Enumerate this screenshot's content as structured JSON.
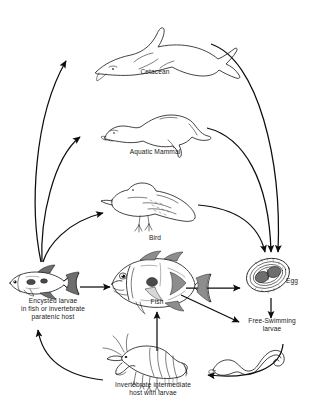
{
  "diagram": {
    "background_color": "#ffffff",
    "ink_color": "#141414",
    "nodes": [
      {
        "id": "cetacean",
        "label": "Cetacean",
        "icon": "dolphin-icon",
        "x": 155,
        "y": 72
      },
      {
        "id": "aquatic-mammal",
        "label": "Aquatic Mammal",
        "icon": "seal-icon",
        "x": 155,
        "y": 152
      },
      {
        "id": "bird",
        "label": "Bird",
        "icon": "gull-icon",
        "x": 155,
        "y": 238
      },
      {
        "id": "encysted-larvae",
        "label": "Encysted larvae\nin fish or invertebrate\nparatenic host",
        "icon": "small-fish-icon",
        "x": 53,
        "y": 303
      },
      {
        "id": "fish",
        "label": "Fish",
        "icon": "fish-icon",
        "x": 157,
        "y": 302
      },
      {
        "id": "egg",
        "label": "Egg",
        "icon": "egg-icon",
        "x": 283,
        "y": 281
      },
      {
        "id": "free-swimming-larvae",
        "label": "Free-Swimming\nlarvae",
        "icon": "larva-worm-icon",
        "x": 272,
        "y": 321
      },
      {
        "id": "invertebrate-host",
        "label": "Invertebrate intermediate\nhost with larvae",
        "icon": "shrimp-icon",
        "x": 152,
        "y": 380
      }
    ],
    "edges": [
      {
        "id": "encysted-to-cetacean",
        "from": "encysted-larvae",
        "to": "cetacean",
        "style": "curved"
      },
      {
        "id": "encysted-to-aquatic-mammal",
        "from": "encysted-larvae",
        "to": "aquatic-mammal",
        "style": "curved"
      },
      {
        "id": "encysted-to-bird",
        "from": "encysted-larvae",
        "to": "bird",
        "style": "curved"
      },
      {
        "id": "cetacean-to-egg",
        "from": "cetacean",
        "to": "egg",
        "style": "curved"
      },
      {
        "id": "aquatic-mammal-to-egg",
        "from": "aquatic-mammal",
        "to": "egg",
        "style": "curved"
      },
      {
        "id": "bird-to-egg",
        "from": "bird",
        "to": "egg",
        "style": "curved"
      },
      {
        "id": "encysted-to-fish",
        "from": "encysted-larvae",
        "to": "fish",
        "style": "straight"
      },
      {
        "id": "fish-to-egg",
        "from": "fish",
        "to": "egg",
        "style": "straight"
      },
      {
        "id": "fish-to-free-swimming-larvae",
        "from": "fish",
        "to": "free-swimming-larvae",
        "style": "straight"
      },
      {
        "id": "egg-to-free-swimming-larvae",
        "from": "egg",
        "to": "free-swimming-larvae",
        "style": "straight"
      },
      {
        "id": "larvae-to-invertebrate-host",
        "from": "free-swimming-larvae",
        "to": "invertebrate-host",
        "style": "curved"
      },
      {
        "id": "invertebrate-host-to-encysted",
        "from": "invertebrate-host",
        "to": "encysted-larvae",
        "style": "curved"
      },
      {
        "id": "invertebrate-host-to-fish",
        "from": "invertebrate-host",
        "to": "fish",
        "style": "straight"
      }
    ]
  }
}
